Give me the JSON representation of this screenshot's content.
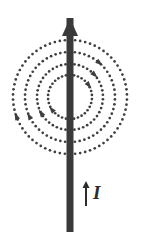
{
  "figure": {
    "name": "magnetic-field-around-current-carrying-wire",
    "background_color": "#ffffff",
    "width": 141,
    "height": 250
  },
  "wire": {
    "name": "vertical-current-wire",
    "color": "#3a3a3a",
    "x": 70,
    "top_y": 18,
    "bottom_y": 232,
    "thickness": 7,
    "arrowhead": {
      "name": "wire-direction-arrowhead",
      "tip_y": 18,
      "base_y": 36,
      "half_width": 8,
      "color": "#3a3a3a"
    }
  },
  "field_lines": {
    "name": "magnetic-field-circles",
    "type": "dotted-concentric-circles",
    "center_x": 70,
    "center_y": 97,
    "color": "#3f3f3f",
    "dot_radius": 1.35,
    "count": 4,
    "radii": [
      22,
      33,
      45,
      57
    ],
    "dot_counts": [
      34,
      46,
      58,
      70
    ]
  },
  "field_arrowheads": {
    "name": "field-direction-arrowheads",
    "color": "#3f3f3f",
    "markers": [
      {
        "circle": 0,
        "angle_deg": -38,
        "label": "inner-circle-upper-right"
      },
      {
        "circle": 1,
        "angle_deg": -46,
        "label": "second-circle-upper-right"
      },
      {
        "circle": 2,
        "angle_deg": -52,
        "label": "third-circle-upper-right"
      },
      {
        "circle": 0,
        "angle_deg": 140,
        "label": "inner-circle-lower-left"
      },
      {
        "circle": 1,
        "angle_deg": 147,
        "label": "second-circle-lower-left"
      },
      {
        "circle": 2,
        "angle_deg": 152,
        "label": "third-circle-lower-left"
      },
      {
        "circle": 3,
        "angle_deg": 158,
        "label": "outer-circle-lower-left"
      }
    ]
  },
  "current_indicator": {
    "name": "current-direction-indicator",
    "label": "I",
    "color": "#2b2b2b",
    "arrow": {
      "name": "current-arrow",
      "x": 86,
      "tip_y": 181,
      "base_y": 206,
      "thickness": 2,
      "head_half_width": 3.5,
      "head_length": 7
    }
  }
}
